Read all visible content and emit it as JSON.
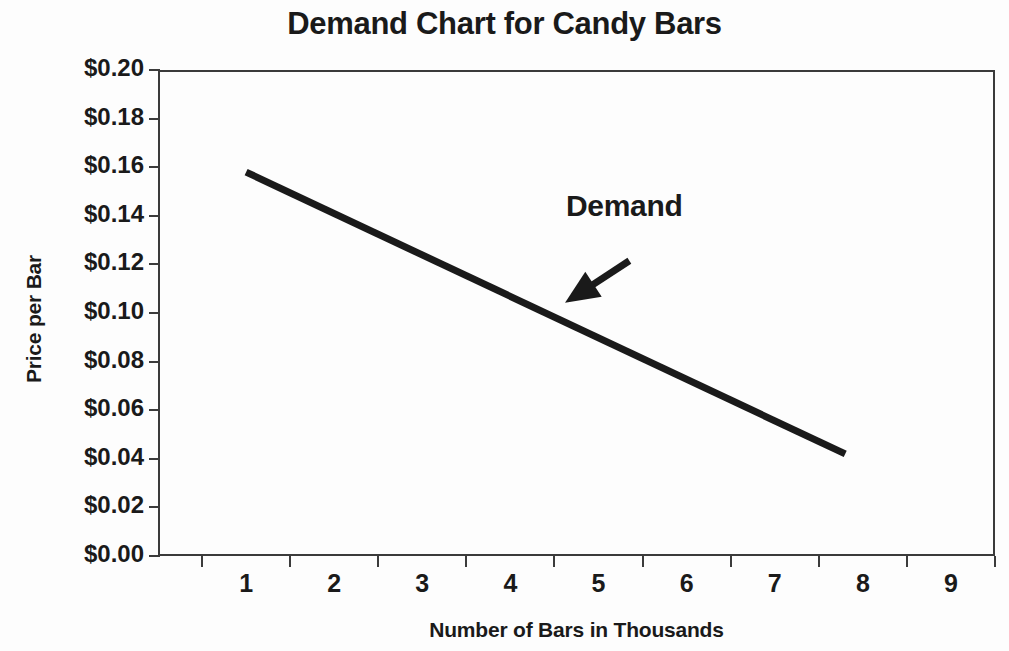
{
  "chart_data": {
    "type": "line",
    "title": "Demand Chart for Candy Bars",
    "xlabel": "Number of Bars in Thousands",
    "ylabel": "Price per Bar",
    "xlim": [
      0,
      9.5
    ],
    "ylim": [
      0,
      0.2
    ],
    "grid": false,
    "legend": "none",
    "xticklabels": [
      "1",
      "2",
      "3",
      "4",
      "5",
      "6",
      "7",
      "8",
      "9"
    ],
    "xtickvalues": [
      1,
      2,
      3,
      4,
      5,
      6,
      7,
      8,
      9
    ],
    "yticklabels": [
      "$0.20",
      "$0.18",
      "$0.16",
      "$0.14",
      "$0.12",
      "$0.10",
      "$0.08",
      "$0.06",
      "$0.04",
      "$0.02",
      "$0.00"
    ],
    "ytickvalues": [
      0.2,
      0.18,
      0.16,
      0.14,
      0.12,
      0.1,
      0.08,
      0.06,
      0.04,
      0.02,
      0.0
    ],
    "series": [
      {
        "name": "Demand",
        "x": [
          1.0,
          7.8
        ],
        "values": [
          0.158,
          0.042
        ],
        "color": "#1a1a1a",
        "linewidth": 7
      }
    ],
    "annotations": [
      {
        "text": "Demand",
        "x": 5.4,
        "y": 0.136,
        "arrow_from": {
          "x": 5.35,
          "y": 0.1215
        },
        "arrow_to": {
          "x": 4.62,
          "y": 0.1042
        }
      }
    ]
  },
  "colors": {
    "line": "#1a1a1a",
    "axis": "#3b3b3b",
    "text": "#1a1a1a",
    "background": "#fdfdfd"
  }
}
